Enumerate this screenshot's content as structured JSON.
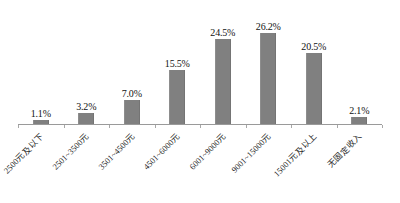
{
  "chart_data": {
    "type": "bar",
    "title": "",
    "subtitle": "",
    "xlabel": "",
    "ylabel": "",
    "ylim": [
      0,
      30
    ],
    "grid": false,
    "legend": "none",
    "bar_color": "#808080",
    "axis_color": "#9a9a9a",
    "label_color": "#121212",
    "label_rotation": -45,
    "categories": [
      "2500元及以下",
      "2501~3500元",
      "3501~4500元",
      "4501~6000元",
      "6001~9000元",
      "9001~15000元",
      "15001元及以上",
      "无固定收入"
    ],
    "values": [
      1.1,
      3.2,
      7.0,
      15.5,
      24.5,
      26.2,
      20.5,
      2.1
    ],
    "data_labels": [
      "1.1%",
      "3.2%",
      "7.0%",
      "15.5%",
      "24.5%",
      "26.2%",
      "20.5%",
      "2.1%"
    ]
  },
  "caption": {
    "text": ""
  }
}
